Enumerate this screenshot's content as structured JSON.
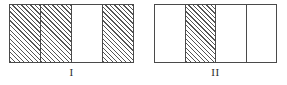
{
  "diagram": {
    "background_color": "#ffffff",
    "stroke_color": "#4a4a4a",
    "hatch_color": "#555555",
    "figures": [
      {
        "id": "figure-i",
        "label": "I",
        "total_parts": 4,
        "shaded_parts": 3,
        "fraction": "3/4",
        "cells": [
          {
            "index": 1,
            "shaded": true
          },
          {
            "index": 2,
            "shaded": true
          },
          {
            "index": 3,
            "shaded": false
          },
          {
            "index": 4,
            "shaded": true
          }
        ]
      },
      {
        "id": "figure-ii",
        "label": "II",
        "total_parts": 4,
        "shaded_parts": 1,
        "fraction": "1/4",
        "cells": [
          {
            "index": 1,
            "shaded": false
          },
          {
            "index": 2,
            "shaded": true
          },
          {
            "index": 3,
            "shaded": false
          },
          {
            "index": 4,
            "shaded": false
          }
        ]
      }
    ]
  }
}
